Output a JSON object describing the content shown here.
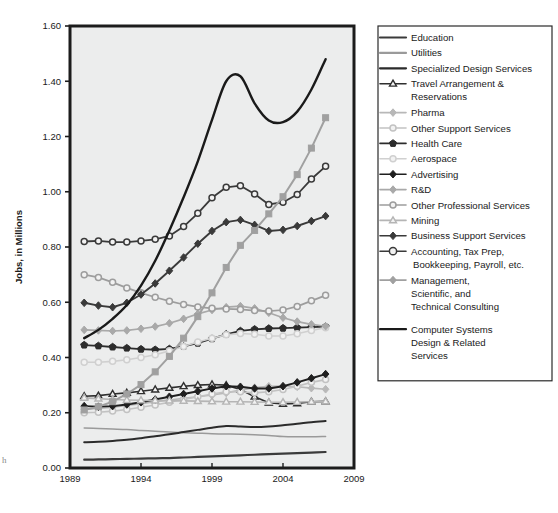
{
  "chart_data": {
    "type": "line",
    "title": "",
    "xlabel": "",
    "ylabel": "Jobs, in Millions",
    "xlim": [
      1989,
      2009
    ],
    "ylim": [
      0.0,
      1.6
    ],
    "xticks": [
      1989,
      1994,
      1999,
      2004,
      2009
    ],
    "yticks": [
      0.0,
      0.2,
      0.4,
      0.6,
      0.8,
      1.0,
      1.2,
      1.4,
      1.6
    ],
    "ytick_labels": [
      "0.00",
      "0.20",
      "0.40",
      "0.60",
      "0.80",
      "1.00",
      "1.20",
      "1.40",
      "1.60"
    ],
    "xtick_labels": [
      "1989",
      "1994",
      "1999",
      "2004",
      "2009"
    ],
    "grid": false,
    "legend_position": "right",
    "x": [
      1990,
      1991,
      1992,
      1993,
      1994,
      1995,
      1996,
      1997,
      1998,
      1999,
      2000,
      2001,
      2002,
      2003,
      2004,
      2005,
      2006,
      2007
    ],
    "series": [
      {
        "name": "Education",
        "color": "#3b3b3b",
        "width": 2.2,
        "marker": "none",
        "values": [
          0.03,
          0.031,
          0.032,
          0.033,
          0.034,
          0.035,
          0.036,
          0.038,
          0.04,
          0.042,
          0.044,
          0.046,
          0.048,
          0.05,
          0.052,
          0.054,
          0.056,
          0.058
        ]
      },
      {
        "name": "Utilities",
        "color": "#9a9a9a",
        "width": 1.5,
        "marker": "none",
        "values": [
          0.145,
          0.143,
          0.141,
          0.139,
          0.136,
          0.133,
          0.13,
          0.128,
          0.126,
          0.124,
          0.123,
          0.122,
          0.12,
          0.118,
          0.114,
          0.113,
          0.113,
          0.114
        ]
      },
      {
        "name": "Specialized Design Services",
        "color": "#2b2b2b",
        "width": 2.0,
        "marker": "none",
        "values": [
          0.093,
          0.095,
          0.098,
          0.102,
          0.108,
          0.115,
          0.122,
          0.13,
          0.138,
          0.146,
          0.152,
          0.15,
          0.148,
          0.15,
          0.155,
          0.16,
          0.166,
          0.17
        ]
      },
      {
        "name": "Travel Arrangement & Reservations",
        "color": "#2f2f2f",
        "width": 1.6,
        "marker": "triangle-open",
        "values": [
          0.26,
          0.262,
          0.268,
          0.272,
          0.278,
          0.284,
          0.29,
          0.296,
          0.3,
          0.302,
          0.3,
          0.284,
          0.258,
          0.236,
          0.232,
          0.234,
          0.24,
          0.241
        ]
      },
      {
        "name": "Pharma",
        "color": "#b8b8b8",
        "width": 1.6,
        "marker": "diamond-filled",
        "values": [
          0.213,
          0.216,
          0.22,
          0.226,
          0.233,
          0.24,
          0.246,
          0.252,
          0.258,
          0.264,
          0.272,
          0.282,
          0.291,
          0.296,
          0.297,
          0.294,
          0.289,
          0.285
        ]
      },
      {
        "name": "Other Support Services",
        "color": "#c2c2c2",
        "width": 1.6,
        "marker": "circle-open",
        "values": [
          0.2,
          0.202,
          0.206,
          0.212,
          0.22,
          0.228,
          0.238,
          0.248,
          0.258,
          0.268,
          0.276,
          0.276,
          0.272,
          0.276,
          0.284,
          0.296,
          0.31,
          0.32
        ]
      },
      {
        "name": "Health Care",
        "color": "#2c2c2c",
        "width": 1.8,
        "marker": "pentagon-filled",
        "values": [
          0.445,
          0.442,
          0.438,
          0.434,
          0.43,
          0.428,
          0.431,
          0.44,
          0.452,
          0.468,
          0.484,
          0.496,
          0.502,
          0.505,
          0.506,
          0.508,
          0.51,
          0.512
        ]
      },
      {
        "name": "Aerospace",
        "color": "#d0d0d0",
        "width": 1.6,
        "marker": "circle-open",
        "values": [
          0.383,
          0.383,
          0.386,
          0.392,
          0.4,
          0.41,
          0.424,
          0.44,
          0.456,
          0.47,
          0.482,
          0.487,
          0.484,
          0.478,
          0.478,
          0.486,
          0.498,
          0.508
        ]
      },
      {
        "name": "Advertising",
        "color": "#1f1f1f",
        "width": 1.9,
        "marker": "diamond-filled",
        "values": [
          0.224,
          0.222,
          0.224,
          0.23,
          0.238,
          0.248,
          0.258,
          0.268,
          0.278,
          0.288,
          0.296,
          0.294,
          0.288,
          0.288,
          0.296,
          0.31,
          0.325,
          0.34
        ]
      },
      {
        "name": "R&D",
        "color": "#a9a9a9",
        "width": 1.7,
        "marker": "diamond-filled",
        "values": [
          0.5,
          0.498,
          0.496,
          0.498,
          0.504,
          0.512,
          0.524,
          0.54,
          0.558,
          0.572,
          0.582,
          0.586,
          0.578,
          0.562,
          0.544,
          0.53,
          0.52,
          0.513
        ]
      },
      {
        "name": "Other Professional Services",
        "color": "#9d9d9d",
        "width": 1.7,
        "marker": "circle-open",
        "values": [
          0.7,
          0.69,
          0.672,
          0.652,
          0.634,
          0.618,
          0.604,
          0.592,
          0.583,
          0.578,
          0.576,
          0.574,
          0.57,
          0.568,
          0.572,
          0.585,
          0.605,
          0.625
        ]
      },
      {
        "name": "Mining",
        "color": "#b5b5b5",
        "width": 1.6,
        "marker": "triangle-open",
        "values": [
          0.254,
          0.251,
          0.248,
          0.246,
          0.245,
          0.244,
          0.244,
          0.243,
          0.242,
          0.241,
          0.24,
          0.24,
          0.239,
          0.238,
          0.238,
          0.239,
          0.24,
          0.241
        ]
      },
      {
        "name": "Business Support Services",
        "color": "#3a3a3a",
        "width": 1.9,
        "marker": "diamond-filled",
        "values": [
          0.598,
          0.588,
          0.582,
          0.598,
          0.628,
          0.668,
          0.714,
          0.762,
          0.812,
          0.858,
          0.89,
          0.898,
          0.88,
          0.858,
          0.862,
          0.876,
          0.894,
          0.912
        ]
      },
      {
        "name": "Accounting, Tax Prep, Bookkeeping, Payroll, etc.",
        "color": "#3a3a3a",
        "width": 1.8,
        "marker": "circle-open",
        "values": [
          0.82,
          0.822,
          0.818,
          0.818,
          0.822,
          0.828,
          0.84,
          0.874,
          0.922,
          0.978,
          1.016,
          1.022,
          0.992,
          0.954,
          0.962,
          0.99,
          1.046,
          1.092
        ]
      },
      {
        "name": "Management, Scientific, and Technical Consulting",
        "color": "#a0a0a0",
        "width": 2.0,
        "marker": "square-filled",
        "values": [
          0.21,
          0.222,
          0.24,
          0.268,
          0.302,
          0.348,
          0.404,
          0.47,
          0.548,
          0.634,
          0.726,
          0.806,
          0.86,
          0.92,
          0.982,
          1.062,
          1.158,
          1.268
        ]
      },
      {
        "name": "Computer Systems Design & Related Services",
        "color": "#1a1a1a",
        "width": 2.4,
        "marker": "none",
        "values": [
          0.47,
          0.5,
          0.54,
          0.59,
          0.66,
          0.75,
          0.86,
          0.98,
          1.11,
          1.26,
          1.4,
          1.418,
          1.32,
          1.258,
          1.252,
          1.29,
          1.37,
          1.48
        ]
      }
    ]
  },
  "legend": {
    "entries": [
      {
        "label": "Education",
        "marker": "none",
        "color": "#3b3b3b"
      },
      {
        "label": "Utilities",
        "marker": "none",
        "color": "#9a9a9a"
      },
      {
        "label": "Specialized Design Services",
        "marker": "none",
        "color": "#2b2b2b"
      },
      {
        "label": "Travel Arrangement &\nReservations",
        "marker": "triangle-open",
        "color": "#2f2f2f"
      },
      {
        "label": "Pharma",
        "marker": "diamond-filled",
        "color": "#b8b8b8"
      },
      {
        "label": "Other Support Services",
        "marker": "circle-open",
        "color": "#c2c2c2"
      },
      {
        "label": "Health Care",
        "marker": "pentagon-filled",
        "color": "#2c2c2c"
      },
      {
        "label": "Aerospace",
        "marker": "circle-open",
        "color": "#d0d0d0"
      },
      {
        "label": "Advertising",
        "marker": "diamond-filled",
        "color": "#1f1f1f"
      },
      {
        "label": "R&D",
        "marker": "diamond-filled",
        "color": "#a9a9a9"
      },
      {
        "label": "Other Professional Services",
        "marker": "circle-open",
        "color": "#9d9d9d"
      },
      {
        "label": "Mining",
        "marker": "triangle-open",
        "color": "#b5b5b5"
      },
      {
        "label": "Business Support Services",
        "marker": "diamond-filled",
        "color": "#3a3a3a"
      },
      {
        "label": "Accounting, Tax Prep,\nBookkeeping, Payroll, etc.",
        "marker": "circle-open-lg",
        "color": "#3a3a3a"
      },
      {
        "label": "Management,\nScientific, and\nTechnical Consulting",
        "marker": "diamond-filled",
        "color": "#a0a0a0"
      },
      {
        "label": "Computer Systems\nDesign & Related\nServices",
        "marker": "none",
        "color": "#1a1a1a"
      }
    ]
  },
  "artifacts": {
    "stray_char": "h"
  }
}
